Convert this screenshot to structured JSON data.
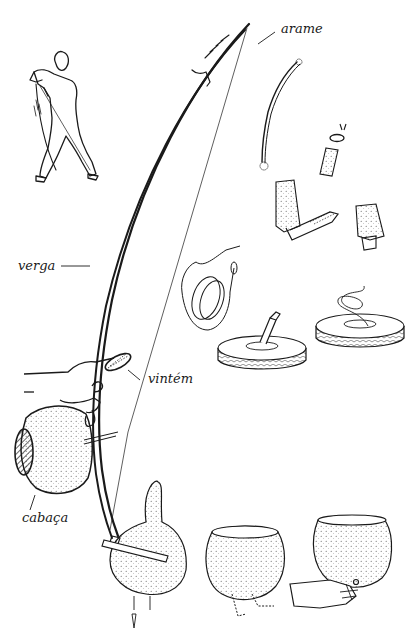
{
  "diagram": {
    "labels": {
      "arame": "arame",
      "verga": "verga",
      "vintem": "vintém",
      "cabaca": "cabaça"
    },
    "colors": {
      "ink": "#1a1a1a",
      "paper": "#ffffff",
      "stipple": "#555555"
    },
    "panels": [
      "player-figure",
      "berimbau-assembled",
      "wire-removed-from-tire",
      "tire-wire-extraction",
      "bow-end-cap",
      "gourd-preparation",
      "gourd-holding"
    ]
  }
}
